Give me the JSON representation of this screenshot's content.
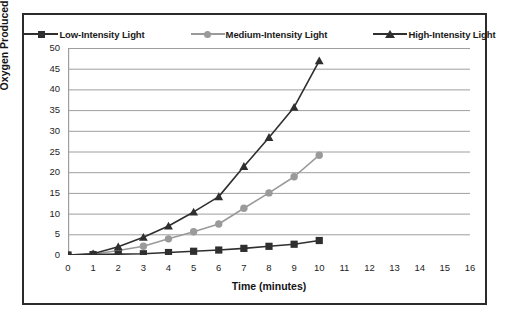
{
  "chart_data": {
    "type": "line",
    "title": "",
    "subtitle": "",
    "xlabel": "Time (minutes)",
    "ylabel": "Oxygen Produced (µl)",
    "xlim": [
      0,
      16
    ],
    "ylim": [
      0,
      50
    ],
    "ytick_step": 5,
    "xtick_step": 1,
    "grid": "horizontal",
    "legend_position": "top-center",
    "x_axis_type": "category",
    "categories": [
      0,
      1,
      2,
      3,
      4,
      5,
      6,
      8,
      10,
      12,
      15
    ],
    "x_tick_labels": [
      "0",
      "1",
      "2",
      "3",
      "4",
      "5",
      "6",
      "7",
      "8",
      "9",
      "10",
      "11",
      "12",
      "13",
      "14",
      "15",
      "16"
    ],
    "y_tick_labels": [
      "0",
      "5",
      "10",
      "15",
      "20",
      "25",
      "30",
      "35",
      "40",
      "45",
      "50"
    ],
    "series": [
      {
        "name": "Low-Intensity Light",
        "color": "#2f2f2f",
        "marker": "square",
        "values": [
          0,
          0.1,
          0.2,
          0.3,
          0.6,
          0.9,
          1.2,
          1.6,
          2.1,
          2.6,
          3.5
        ]
      },
      {
        "name": "Medium-Intensity Light",
        "color": "#9a9a9a",
        "marker": "circle",
        "values": [
          0,
          0.2,
          1.1,
          2.1,
          3.9,
          5.6,
          7.5,
          11.3,
          15.0,
          18.9,
          24.1
        ]
      },
      {
        "name": "High-Intensity Light",
        "color": "#2f2f2f",
        "marker": "triangle",
        "values": [
          0,
          0.3,
          2.0,
          4.3,
          7.0,
          10.4,
          14.1,
          21.4,
          28.4,
          35.7,
          46.9
        ]
      }
    ]
  },
  "legend": {
    "items": [
      {
        "label": "Low-Intensity Light",
        "marker": "square-marker",
        "color": "#2f2f2f"
      },
      {
        "label": "Medium-Intensity Light",
        "marker": "circle-marker",
        "color": "#9a9a9a"
      },
      {
        "label": "High-Intensity Light",
        "marker": "triangle-marker",
        "color": "#2f2f2f"
      }
    ]
  },
  "axes": {
    "y_title": "Oxygen Produced (µl)",
    "x_title": "Time (minutes)"
  },
  "style": {
    "frame_color": "#2b2b2b",
    "grid_color": "#9e9e9e",
    "background": "#ffffff"
  }
}
